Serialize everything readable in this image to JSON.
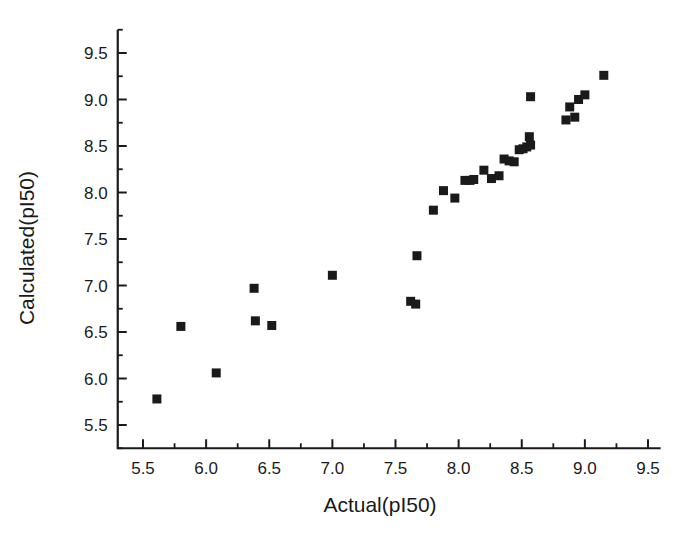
{
  "chart_data": {
    "type": "scatter",
    "title": "",
    "xlabel": "Actual(pI50)",
    "ylabel": "Calculated(pI50)",
    "xlim": [
      5.3,
      9.6
    ],
    "ylim": [
      5.25,
      9.75
    ],
    "xticks": [
      "5.5",
      "6.0",
      "6.5",
      "7.0",
      "7.5",
      "8.0",
      "8.5",
      "9.0",
      "9.5"
    ],
    "xtick_values": [
      5.5,
      6.0,
      6.5,
      7.0,
      7.5,
      8.0,
      8.5,
      9.0,
      9.5
    ],
    "yticks": [
      "5.5",
      "6.0",
      "6.5",
      "7.0",
      "7.5",
      "8.0",
      "8.5",
      "9.0",
      "9.5"
    ],
    "ytick_values": [
      5.5,
      6.0,
      6.5,
      7.0,
      7.5,
      8.0,
      8.5,
      9.0,
      9.5
    ],
    "minor_ticks": true,
    "grid": false,
    "legend": null,
    "marker": "filled-square",
    "marker_color": "#1a1a1a",
    "marker_size": 9,
    "series": [
      {
        "name": "compounds",
        "x": [
          5.61,
          5.8,
          6.08,
          6.38,
          6.39,
          6.52,
          7.0,
          7.62,
          7.66,
          7.67,
          7.8,
          7.88,
          7.97,
          8.05,
          8.09,
          8.12,
          8.2,
          8.26,
          8.32,
          8.36,
          8.4,
          8.44,
          8.48,
          8.51,
          8.54,
          8.57,
          8.56,
          8.57,
          8.85,
          8.88,
          8.92,
          8.95,
          9.0,
          9.15
        ],
        "y": [
          5.78,
          6.56,
          6.06,
          6.97,
          6.62,
          6.57,
          7.11,
          6.83,
          6.8,
          7.32,
          7.81,
          8.02,
          7.94,
          8.13,
          8.13,
          8.14,
          8.24,
          8.15,
          8.18,
          8.36,
          8.34,
          8.33,
          8.46,
          8.47,
          8.49,
          8.51,
          8.6,
          9.03,
          8.78,
          8.92,
          8.81,
          9.0,
          9.05,
          9.26
        ]
      }
    ]
  },
  "axis": {
    "x_label": "Actual(pI50)",
    "y_label": "Calculated(pI50)"
  }
}
